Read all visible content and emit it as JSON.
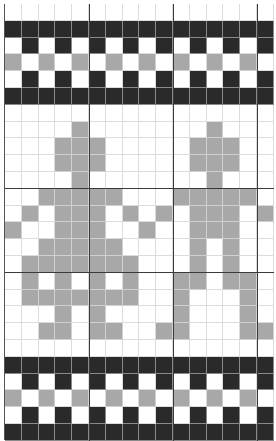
{
  "chart_title": "Knitting chart - figure motif with checkered borders",
  "legend": {
    "0": {
      "name": "background",
      "color": "#ffffff"
    },
    "1": {
      "name": "dark-stitch",
      "color": "#2a2a2a"
    },
    "2": {
      "name": "gray-stitch",
      "color": "#a8a8a8"
    }
  },
  "grid": {
    "columns": 16,
    "rows": 26,
    "major_every": 5,
    "cells": [
      "0000000000000000",
      "1111111111111111",
      "0101010101010101",
      "2020202020202020",
      "0101010101010101",
      "1111111111111111",
      "0000000000000000",
      "0000200000002000",
      "0002220000022200",
      "0002220000022200",
      "0000200000002000",
      "0022222000222220",
      "0202220202022202",
      "2002220020022200",
      "0022222000020200",
      "0222222200020200",
      "0202020200220220",
      "0222222200200020",
      "0002020000200020",
      "0022022002200022",
      "0000000000000000",
      "1111111111111111",
      "0101010101010101",
      "2020202020202020",
      "0101010101010101",
      "1111111111111111"
    ]
  },
  "chart_data": {
    "type": "heatmap",
    "title": "",
    "grid_lines": true,
    "major_gridlines_x": [
      5,
      10,
      15
    ],
    "major_gridlines_y": [
      11,
      16
    ]
  }
}
